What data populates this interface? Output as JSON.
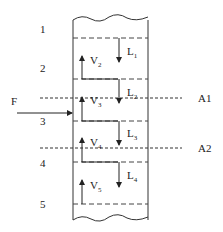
{
  "stages": [
    "1",
    "2",
    "3",
    "4",
    "5"
  ],
  "liquid_flows": [
    {
      "label": "L",
      "sub": "1"
    },
    {
      "label": "L",
      "sub": "2"
    },
    {
      "label": "L",
      "sub": "3"
    },
    {
      "label": "L",
      "sub": "4"
    }
  ],
  "vapor_flows": [
    {
      "label": "V",
      "sub": "2"
    },
    {
      "label": "V",
      "sub": "3"
    },
    {
      "label": "V",
      "sub": "4"
    },
    {
      "label": "V",
      "sub": "5"
    }
  ],
  "feed": "F",
  "sections": [
    "A1",
    "A2"
  ]
}
